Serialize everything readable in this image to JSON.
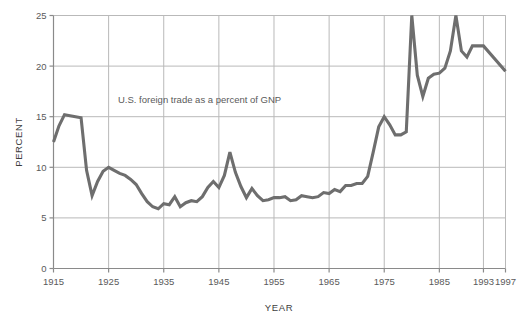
{
  "chart_data": {
    "type": "line",
    "title": "",
    "subtitle": "",
    "annotation": "U.S. foreign trade as a percent of GNP",
    "xlabel": "YEAR",
    "ylabel": "PERCENT",
    "xlim": [
      1915,
      1997
    ],
    "ylim": [
      0,
      25
    ],
    "xticks": [
      1915,
      1925,
      1935,
      1945,
      1955,
      1965,
      1975,
      1985,
      1993,
      1997
    ],
    "xticklabels": [
      "1915",
      "1925",
      "1935",
      "1945",
      "1955",
      "1965",
      "1975",
      "1985",
      "1993",
      "1997"
    ],
    "yticks": [
      0,
      5,
      10,
      15,
      20,
      25
    ],
    "yticklabels": [
      "0",
      "5",
      "10",
      "15",
      "20",
      "25"
    ],
    "grid": "both",
    "legend": "none",
    "line_color": "#6e6e6e",
    "grid_color": "#b9b9b9",
    "axis_color": "#8a8a8a",
    "text_color": "#5a5a5a",
    "background": "#ffffff",
    "series": [
      {
        "name": "U.S. foreign trade as a percent of GNP",
        "x": [
          1915,
          1916,
          1917,
          1918,
          1919,
          1920,
          1921,
          1922,
          1923,
          1924,
          1925,
          1926,
          1927,
          1928,
          1929,
          1930,
          1931,
          1932,
          1933,
          1934,
          1935,
          1936,
          1937,
          1938,
          1939,
          1940,
          1941,
          1942,
          1943,
          1944,
          1945,
          1946,
          1947,
          1948,
          1949,
          1950,
          1951,
          1952,
          1953,
          1954,
          1955,
          1956,
          1957,
          1958,
          1959,
          1960,
          1961,
          1962,
          1963,
          1964,
          1965,
          1966,
          1967,
          1968,
          1969,
          1970,
          1971,
          1972,
          1973,
          1974,
          1975,
          1976,
          1977,
          1978,
          1979,
          1980,
          1981,
          1982,
          1983,
          1984,
          1985,
          1986,
          1987,
          1988,
          1989,
          1990,
          1991,
          1992,
          1993,
          1997
        ],
        "y": [
          12.5,
          14.1,
          15.2,
          15.1,
          15.0,
          14.9,
          9.7,
          7.2,
          8.6,
          9.6,
          10.0,
          9.7,
          9.4,
          9.2,
          8.8,
          8.3,
          7.4,
          6.6,
          6.1,
          5.9,
          6.4,
          6.3,
          7.1,
          6.1,
          6.5,
          6.7,
          6.6,
          7.1,
          8.0,
          8.6,
          8.0,
          9.2,
          11.5,
          9.5,
          8.1,
          7.0,
          7.9,
          7.2,
          6.7,
          6.8,
          7.0,
          7.0,
          7.1,
          6.7,
          6.8,
          7.2,
          7.1,
          7.0,
          7.1,
          7.5,
          7.4,
          7.8,
          7.6,
          8.2,
          8.2,
          8.4,
          8.4,
          9.1,
          11.5,
          14.0,
          15.0,
          14.2,
          13.2,
          13.2,
          13.5,
          25.0,
          19.1,
          17.0,
          18.8,
          19.2,
          19.3,
          19.8,
          21.5,
          25.0,
          21.5,
          20.9,
          22.0,
          22.0,
          22.0,
          19.5
        ]
      }
    ]
  },
  "axis": {
    "y_label": "PERCENT",
    "x_label": "YEAR"
  }
}
